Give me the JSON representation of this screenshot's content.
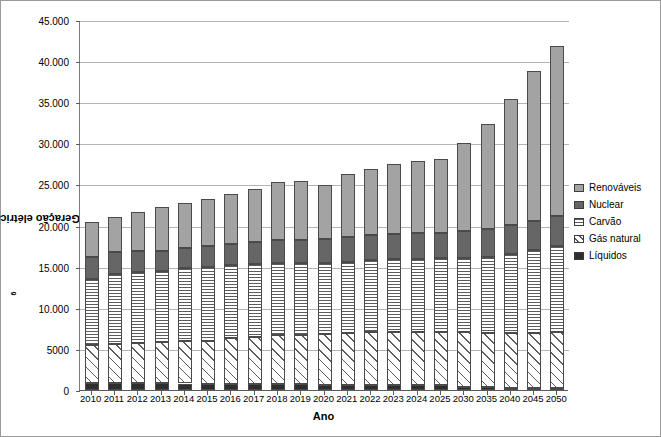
{
  "chart_data": {
    "type": "bar",
    "subtype": "stacked",
    "title": "",
    "xlabel": "Ano",
    "ylabel": "Geração elétrica mundial x10⁶ kWh",
    "ylabel_base": "Geração elétrica mundial x10",
    "ylabel_exponent": "6",
    "ylabel_unit": " kWh",
    "ylim": [
      0,
      45000
    ],
    "ytick_step": 5000,
    "ytick_labels": [
      "0",
      "5000",
      "10.000",
      "15.000",
      "20.000",
      "25.000",
      "30.000",
      "35.000",
      "40.000",
      "45.000"
    ],
    "ytick_values": [
      0,
      5000,
      10000,
      15000,
      20000,
      25000,
      30000,
      35000,
      40000,
      45000
    ],
    "grid": true,
    "legend_position": "right",
    "categories": [
      "2010",
      "2011",
      "2012",
      "2013",
      "2014",
      "2015",
      "2016",
      "2017",
      "2018",
      "2019",
      "2020",
      "2021",
      "2022",
      "2023",
      "2024",
      "2025",
      "2030",
      "2035",
      "2040",
      "2045",
      "2050"
    ],
    "series": [
      {
        "name": "Líquidos",
        "color": "#2e2e2e",
        "pattern": "solid-dark",
        "values": [
          900,
          900,
          860,
          820,
          790,
          760,
          740,
          720,
          700,
          680,
          660,
          640,
          620,
          600,
          580,
          560,
          420,
          340,
          300,
          280,
          260
        ]
      },
      {
        "name": "Gás natural",
        "color": "#e0e0e0",
        "pattern": "diagonal-hatch",
        "values": [
          4550,
          4700,
          4840,
          4980,
          5110,
          5240,
          5560,
          5780,
          5950,
          6020,
          6120,
          6260,
          6380,
          6480,
          6520,
          6540,
          6580,
          6560,
          6600,
          6700,
          6800
        ]
      },
      {
        "name": "Carvão",
        "color": "#e8e8e8",
        "pattern": "horizontal-lines",
        "values": [
          8050,
          8500,
          8600,
          8700,
          8900,
          9000,
          8900,
          8800,
          8750,
          8700,
          8650,
          8700,
          8800,
          8800,
          8850,
          8900,
          9000,
          9300,
          9650,
          10000,
          10400
        ]
      },
      {
        "name": "Nuclear",
        "color": "#666666",
        "pattern": "solid-gray",
        "values": [
          2650,
          2700,
          2550,
          2400,
          2450,
          2500,
          2600,
          2700,
          2800,
          2850,
          2900,
          2950,
          3000,
          3050,
          3100,
          3150,
          3300,
          3400,
          3500,
          3600,
          3700
        ]
      },
      {
        "name": "Renováveis",
        "color": "#a3a3a3",
        "pattern": "solid-lightgray",
        "values": [
          4250,
          4300,
          4750,
          5400,
          5450,
          5700,
          6000,
          6500,
          7150,
          7200,
          6650,
          7750,
          8100,
          8550,
          8750,
          8900,
          10750,
          12750,
          15350,
          18200,
          20700
        ]
      }
    ],
    "totals": [
      20400,
      21100,
      21600,
      22300,
      22700,
      23200,
      23800,
      24500,
      25350,
      25450,
      24980,
      26300,
      26900,
      27480,
      27800,
      28050,
      30050,
      32350,
      35400,
      38780,
      41860
    ]
  },
  "legend": {
    "items": [
      {
        "label": "Renováveis",
        "key": "renovaveis"
      },
      {
        "label": "Nuclear",
        "key": "nuclear"
      },
      {
        "label": "Carvão",
        "key": "carvao"
      },
      {
        "label": "Gás natural",
        "key": "gas"
      },
      {
        "label": "Líquidos",
        "key": "liquidos"
      }
    ]
  }
}
